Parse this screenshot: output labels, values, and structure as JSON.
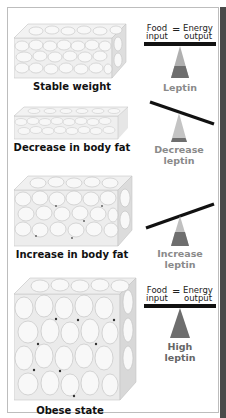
{
  "panels": [
    {
      "caption": "Stable weight",
      "balance": "level",
      "equation": {
        "left_top": "Food",
        "left_bottom": "input",
        "sign": "=",
        "right_top": "Energy",
        "right_bottom": "output"
      },
      "leptin_label": [
        "Leptin",
        ""
      ],
      "leptin_level": "moderate",
      "fulcrum_fill": "#b0b0b0",
      "fulcrum_base": "#6e6e6e"
    },
    {
      "caption": "Decrease in body fat",
      "balance": "tilted-right-down",
      "leptin_label": [
        "Decrease",
        "leptin"
      ],
      "leptin_level": "low",
      "fulcrum_fill": "#c4c4c4",
      "fulcrum_base": "#6e6e6e"
    },
    {
      "caption": "Increase in body fat",
      "balance": "tilted-left-down",
      "leptin_label": [
        "Increase",
        "leptin"
      ],
      "leptin_level": "elevated",
      "fulcrum_fill": "#c0c0c0",
      "fulcrum_base": "#6e6e6e"
    },
    {
      "caption": "Obese state",
      "balance": "level",
      "equation": {
        "left_top": "Food",
        "left_bottom": "input",
        "sign": "=",
        "right_top": "Energy",
        "right_bottom": "output"
      },
      "leptin_label": [
        "High",
        "leptin"
      ],
      "leptin_level": "high",
      "fulcrum_fill": "#6e6e6e",
      "fulcrum_base": "#6e6e6e"
    }
  ],
  "colors": {
    "beam": "#111111",
    "label_gray": "#8a8a8a",
    "cell": "#ececec",
    "cell_edge": "#bdbdbd",
    "right_bar": "#4a4a4a"
  }
}
